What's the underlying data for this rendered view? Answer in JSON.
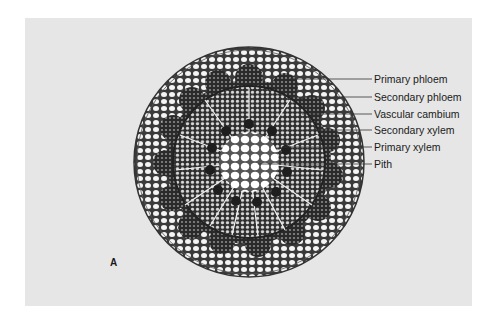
{
  "figure": {
    "letter": "A",
    "background_color": "#e6e6e6"
  },
  "labels": [
    {
      "text": "Primary phloem",
      "y": 99
    },
    {
      "text": "Secondary phloem",
      "y": 116
    },
    {
      "text": "Vascular cambium",
      "y": 133
    },
    {
      "text": "Secondary xylem",
      "y": 149
    },
    {
      "text": "Primary xylem",
      "y": 166
    },
    {
      "text": "Pith",
      "y": 182
    }
  ]
}
